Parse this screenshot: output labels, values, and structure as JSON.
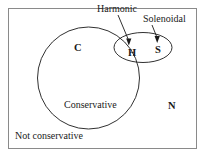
{
  "figure": {
    "border_color": "#8a8a8a",
    "stroke_color": "#1a1a1a",
    "background": "#ffffff"
  },
  "labels": {
    "harmonic": "Harmonic",
    "solenoidal": "Solenoidal",
    "conservative_set": "C",
    "harmonic_set": "H",
    "solenoidal_set": "S",
    "not_conservative_set": "N",
    "conservative_region": "Conservative",
    "not_conservative_region": "Not conservative"
  },
  "annotations": [
    {
      "name": "harmonic-arrow",
      "label": "Harmonic",
      "points_to": "H"
    },
    {
      "name": "solenoidal-arrow",
      "label": "Solenoidal",
      "points_to": "S"
    }
  ],
  "sets": [
    {
      "name": "conservative-circle",
      "symbol": "C",
      "label": "Conservative",
      "shape": "circle"
    },
    {
      "name": "solenoidal-ellipse",
      "symbol": "S",
      "label": "Solenoidal",
      "shape": "ellipse"
    },
    {
      "name": "harmonic-intersection",
      "symbol": "H",
      "label": "Harmonic",
      "shape": "lens"
    },
    {
      "name": "not-conservative-region",
      "symbol": "N",
      "label": "Not conservative",
      "shape": "rectangle"
    }
  ]
}
